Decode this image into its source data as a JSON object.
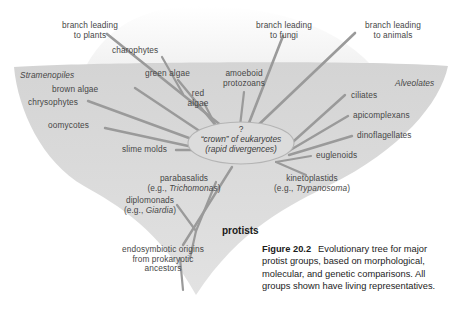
{
  "figure": {
    "number": "Figure 20.2",
    "caption": "Evolutionary tree for major protist groups, based on morphological, molecular, and genetic comparisons. All groups shown have living representatives."
  },
  "colors": {
    "background": "#ffffff",
    "funnel_fill": "#d9d9d9",
    "branch_line": "#9a9a9a",
    "label_text": "#474747",
    "caption_text": "#1c1c1c",
    "crown_outline": "#b0b0b0"
  },
  "crown_node": {
    "question_mark": "?",
    "line1": "“crown” of eukaryotes",
    "line2": "(rapid divergences)"
  },
  "group_headings": [
    {
      "id": "stramenopiles",
      "label": "Stramenopiles",
      "style": "italic"
    },
    {
      "id": "alveolates",
      "label": "Alveolates",
      "style": "italic"
    },
    {
      "id": "protists",
      "label": "protists",
      "style": "bold"
    }
  ],
  "top_branches": [
    {
      "id": "plants",
      "line1": "branch leading",
      "line2": "to plants"
    },
    {
      "id": "fungi",
      "line1": "branch leading",
      "line2": "to fungi"
    },
    {
      "id": "animals",
      "line1": "branch leading",
      "line2": "to animals"
    }
  ],
  "taxa": [
    {
      "id": "charophytes",
      "label": "charophytes"
    },
    {
      "id": "green-algae",
      "label": "green algae"
    },
    {
      "id": "red-algae-1",
      "label": "red"
    },
    {
      "id": "red-algae-2",
      "label": "algae"
    },
    {
      "id": "amoeboid-1",
      "label": "amoeboid"
    },
    {
      "id": "amoeboid-2",
      "label": "protozoans"
    },
    {
      "id": "brown-algae",
      "label": "brown algae"
    },
    {
      "id": "chrysophytes",
      "label": "chrysophytes"
    },
    {
      "id": "oomycotes",
      "label": "oomycotes"
    },
    {
      "id": "slime-molds",
      "label": "slime molds"
    },
    {
      "id": "ciliates",
      "label": "ciliates"
    },
    {
      "id": "apicomplexans",
      "label": "apicomplexans"
    },
    {
      "id": "dinoflagellates",
      "label": "dinoflagellates"
    },
    {
      "id": "euglenoids",
      "label": "euglenoids"
    }
  ],
  "taxa_with_example": [
    {
      "id": "parabasalids",
      "name": "parabasalids",
      "example_prefix": "(e.g., ",
      "example_genus": "Trichomonas",
      "example_suffix": ")"
    },
    {
      "id": "diplomonads",
      "name": "diplomonads",
      "example_prefix": "(e.g., ",
      "example_genus": "Giardia",
      "example_suffix": ")"
    },
    {
      "id": "kinetoplastids",
      "name": "kinetoplastids",
      "example_prefix": "(e.g., ",
      "example_genus": "Trypanosoma",
      "example_suffix": ")"
    }
  ],
  "root_label": {
    "line1": "endosymbiotic origins",
    "line2": "from prokaryotic",
    "line3": "ancestors"
  }
}
